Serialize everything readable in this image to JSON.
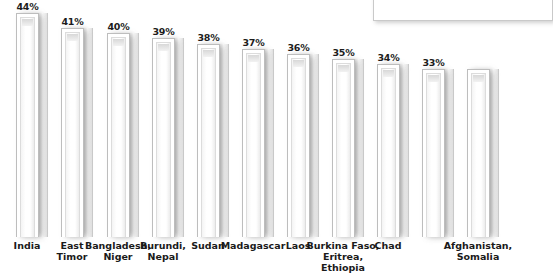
{
  "chart_data": {
    "type": "bar",
    "title": "",
    "subtitle": "",
    "xlabel": "",
    "ylabel": "",
    "ylim": [
      0,
      44
    ],
    "grid": false,
    "legend": "none",
    "orientation": "vertical",
    "value_suffix": "%",
    "categories": [
      "India",
      "East\nTimor",
      "Bangladesh,\nNiger",
      "Burundi,\nNepal",
      "Sudan",
      "Madagascar",
      "Laos",
      "Burkina Faso,\nEritrea,\nEthiopia",
      "Chad",
      "Afghanistan,\nSomalia"
    ],
    "values": [
      44,
      41,
      40,
      39,
      38,
      37,
      36,
      35,
      34,
      33
    ],
    "value_labels": [
      "44%",
      "41%",
      "40%",
      "39%",
      "38%",
      "37%",
      "36%",
      "35%",
      "34%",
      "33%"
    ],
    "bar_count_drawn": 11,
    "colors": {
      "bar_face": "#ffffff",
      "bar_outline": "#bdbdbd",
      "bar_shadow": "#8c8c8c",
      "label_text": "#1a1a1a",
      "value_text": "#1c1c1c",
      "background": "#ffffff",
      "legend_box_border": "#c9c9c9"
    }
  },
  "legend_box": {
    "label": "",
    "visible": true
  }
}
